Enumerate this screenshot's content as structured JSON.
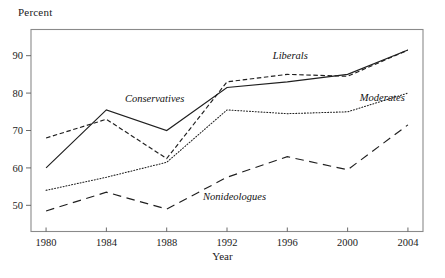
{
  "chart_data": {
    "type": "line",
    "title": "",
    "xlabel": "Year",
    "ylabel": "Percent",
    "x": [
      1980,
      1984,
      1988,
      1992,
      1996,
      2000,
      2004
    ],
    "xtick_labels": [
      "1980",
      "1984",
      "1988",
      "1992",
      "1996",
      "2000",
      "2004"
    ],
    "ytick_labels": [
      "50",
      "60",
      "70",
      "80",
      "90"
    ],
    "yticks": [
      50,
      60,
      70,
      80,
      90
    ],
    "ylim": [
      43,
      97
    ],
    "xlim": [
      1979,
      2005
    ],
    "grid": false,
    "legend": "inline-annotations",
    "series": [
      {
        "name": "Conservatives",
        "style": "solid",
        "label_x": 1987.2,
        "label_y": 77.5,
        "values": [
          60.0,
          75.5,
          70.0,
          81.5,
          83.0,
          85.0,
          91.5
        ]
      },
      {
        "name": "Liberals",
        "style": "dash-short",
        "label_x": 1996.2,
        "label_y": 89.0,
        "values": [
          68.0,
          73.0,
          62.5,
          83.0,
          85.0,
          84.5,
          91.5
        ]
      },
      {
        "name": "Moderates",
        "style": "dotted",
        "label_x": 2002.3,
        "label_y": 77.8,
        "values": [
          54.0,
          57.5,
          61.5,
          75.5,
          74.5,
          75.0,
          80.0
        ]
      },
      {
        "name": "Nonideologues",
        "style": "dash-long",
        "label_x": 1992.5,
        "label_y": 51.5,
        "values": [
          48.5,
          53.5,
          49.0,
          57.5,
          63.0,
          59.5,
          71.5
        ]
      }
    ],
    "colors": {
      "line": "#1f1f1f",
      "frame": "#8a8a8a",
      "text": "#1a1a1a",
      "background": "#ffffff"
    }
  }
}
